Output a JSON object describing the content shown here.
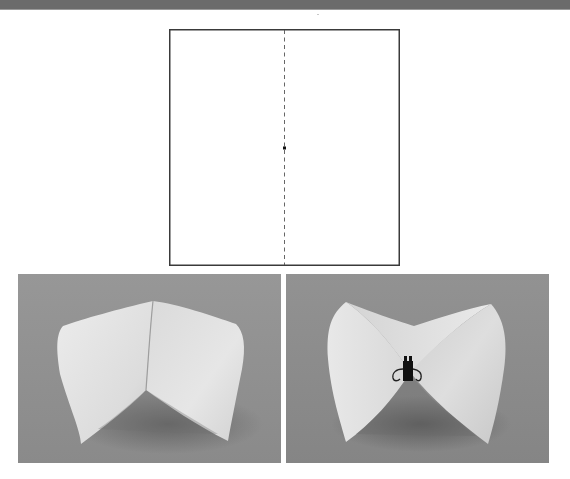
{
  "figure": {
    "diagram": {
      "description": "Square sheet of paper with a dashed vertical fold line down the center and a small dot at its midpoint",
      "outline_color": "#3a3a3a",
      "fold_line_style": "dashed",
      "center_point": "dot"
    },
    "photos": [
      {
        "id": "left",
        "description": "Paper folded along the center line forming two curved cone-like halves, viewed from the front",
        "background_color": "#8f8f8f",
        "paper_color": "#e4e4e4"
      },
      {
        "id": "right",
        "description": "Paper bent into a saddle / bow-tie shape held at the center by a black binder clip",
        "background_color": "#8a8a8a",
        "paper_color": "#e2e2e2",
        "accessory": "binder-clip"
      }
    ]
  },
  "colors": {
    "top_bar": "#6b6b6b",
    "page_background": "#ffffff"
  }
}
